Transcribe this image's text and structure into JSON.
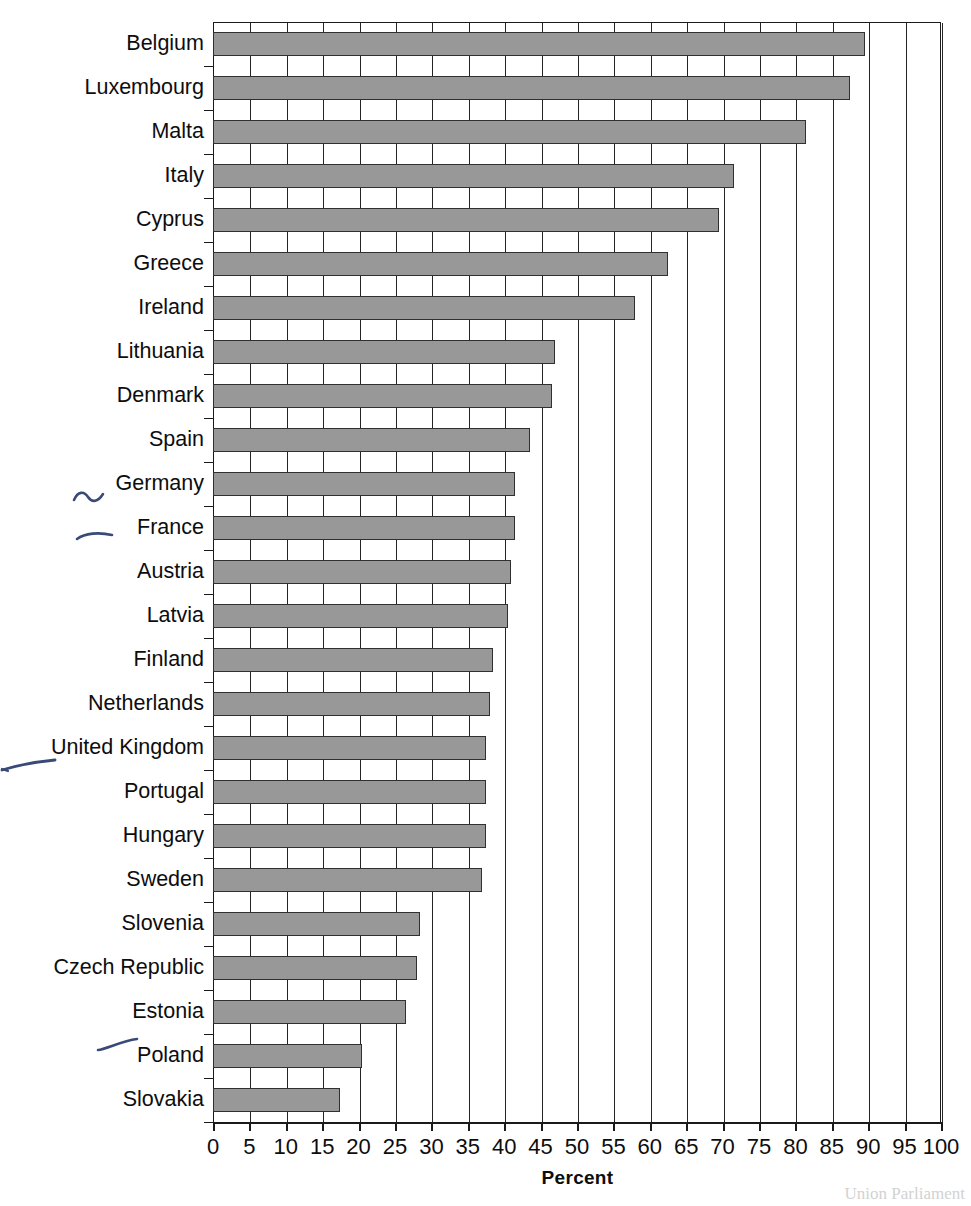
{
  "chart_data": {
    "type": "bar",
    "orientation": "horizontal",
    "title": "",
    "xlabel": "Percent",
    "ylabel": "",
    "xlim": [
      0,
      100
    ],
    "xticks": [
      0,
      5,
      10,
      15,
      20,
      25,
      30,
      35,
      40,
      45,
      50,
      55,
      60,
      65,
      70,
      75,
      80,
      85,
      90,
      95,
      100
    ],
    "xtick_labels": [
      "0",
      "5",
      "10",
      "15",
      "20",
      "25",
      "30",
      "35",
      "40",
      "45",
      "50",
      "55",
      "60",
      "65",
      "70",
      "75",
      "80",
      "85",
      "90",
      "95",
      "100"
    ],
    "grid": "vertical",
    "legend": "none",
    "bar_color": "#989898",
    "bar_edge_color": "#303030",
    "categories": [
      "Belgium",
      "Luxembourg",
      "Malta",
      "Italy",
      "Cyprus",
      "Greece",
      "Ireland",
      "Lithuania",
      "Denmark",
      "Spain",
      "Germany",
      "France",
      "Austria",
      "Latvia",
      "Finland",
      "Netherlands",
      "United Kingdom",
      "Portugal",
      "Hungary",
      "Sweden",
      "Slovenia",
      "Czech Republic",
      "Estonia",
      "Poland",
      "Slovakia"
    ],
    "values": [
      89.5,
      87.5,
      81.5,
      71.5,
      69.5,
      62.5,
      58,
      47,
      46.5,
      43.5,
      41.5,
      41.5,
      41,
      40.5,
      38.5,
      38,
      37.5,
      37.5,
      37.5,
      37,
      28.5,
      28,
      26.5,
      20.5,
      17.5
    ]
  },
  "annotations": {
    "pen_marks": [
      {
        "name": "tilde-mark-germany",
        "label": "~",
        "near": "Germany"
      },
      {
        "name": "dash-mark-france",
        "label": "—",
        "near": "France"
      },
      {
        "name": "dash-mark-united-kingdom",
        "label": "—",
        "near": "United Kingdom"
      },
      {
        "name": "dash-mark-poland",
        "label": "—",
        "near": "Poland"
      }
    ]
  },
  "footer": {
    "ghost_text": "Union Parliament"
  }
}
